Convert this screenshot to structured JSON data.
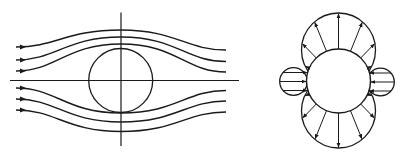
{
  "figure": {
    "width": 400,
    "height": 157,
    "stroke_color": "#1a1a1a",
    "background": "#ffffff",
    "left_panel": {
      "name": "streamlines-around-cylinder",
      "horizontal_axis": {
        "x1": 10,
        "x2": 239,
        "y": 80.5
      },
      "vertical_axis": {
        "x": 121,
        "y1": 12.5,
        "y2": 146
      },
      "cylinder": {
        "cx": 120.7,
        "cy": 80.5,
        "r": 32
      },
      "streamlines": [
        {
          "y_in": 47,
          "y_mid": 30,
          "y_out": 50
        },
        {
          "y_in": 60,
          "y_mid": 37,
          "y_out": 61.5
        },
        {
          "y_in": 71,
          "y_mid": 44,
          "y_out": 72
        },
        {
          "y_in": 88,
          "y_mid": 113,
          "y_out": 90.5
        },
        {
          "y_in": 99,
          "y_mid": 122,
          "y_out": 101
        },
        {
          "y_in": 110,
          "y_mid": 131.5,
          "y_out": 112
        }
      ],
      "stream_x_start": 16,
      "stream_x_end": 226
    },
    "right_panel": {
      "name": "pressure-distribution-around-cylinder",
      "cylinder": {
        "cx": 338.5,
        "cy": 81,
        "r": 32
      },
      "top_lobe": {
        "cx": 338.5,
        "cy": 50,
        "r": 37,
        "direction": "outward"
      },
      "bottom_lobe": {
        "cx": 338.5,
        "cy": 111,
        "r": 37,
        "direction": "outward"
      },
      "left_lobe": {
        "cx": 293.5,
        "cy": 81.5,
        "r": 13.8,
        "direction": "inward"
      },
      "right_lobe": {
        "cx": 380.5,
        "cy": 82,
        "r": 13.8,
        "direction": "inward"
      },
      "top_arrow_angles_deg": [
        90,
        68,
        46,
        24,
        112,
        134,
        156
      ],
      "side_arrow_offsets": [
        -9,
        0,
        9
      ]
    }
  }
}
